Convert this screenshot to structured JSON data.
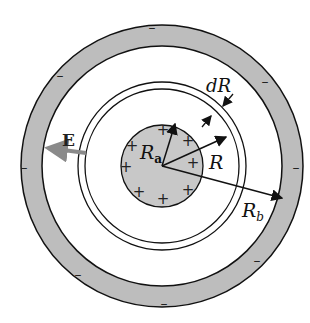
{
  "diagram": {
    "labels": {
      "field": "E",
      "inner_radius": "R",
      "inner_radius_sub": "a",
      "outer_radius": "R",
      "outer_radius_sub": "b",
      "shell_radius": "R",
      "shell_thickness": "dR"
    },
    "signs": {
      "plus": "+",
      "minus": "–"
    },
    "colors": {
      "shell_fill": "#bdbdbd",
      "sphere_fill": "#c8c8c8",
      "line": "#111111",
      "field_arrow": "#8a8a8a"
    },
    "counts": {
      "plus_charges": 8,
      "minus_charges": 8
    }
  }
}
